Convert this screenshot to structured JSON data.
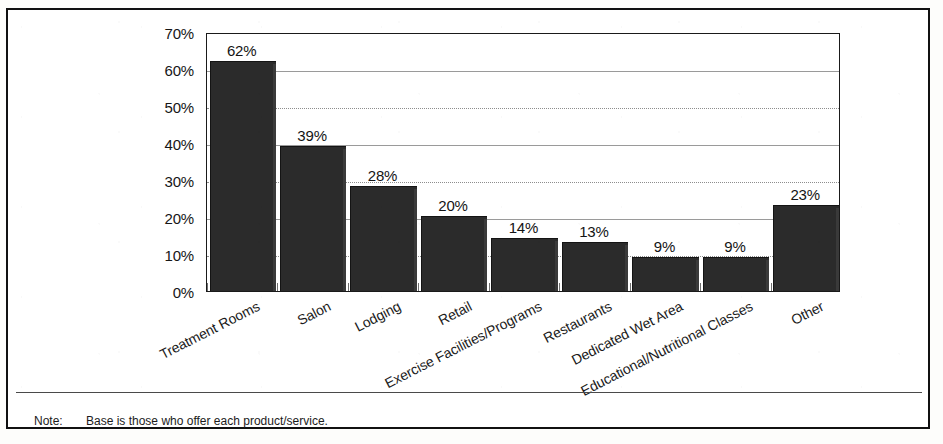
{
  "frame": {
    "title_fragment": ""
  },
  "chart_data": {
    "type": "bar",
    "title": "",
    "xlabel": "",
    "ylabel": "Percent of Revenue",
    "ylim": [
      0,
      70
    ],
    "ytick_step": 10,
    "ytick_labels": [
      "0%",
      "10%",
      "20%",
      "30%",
      "40%",
      "50%",
      "60%",
      "70%"
    ],
    "ytick_values": [
      0,
      10,
      20,
      30,
      40,
      50,
      60,
      70
    ],
    "grid": true,
    "legend": "none",
    "categories": [
      "Treatment Rooms",
      "Salon",
      "Lodging",
      "Retail",
      "Exercise Facilities/Programs",
      "Restaurants",
      "Dedicated Wet Area",
      "Educational/Nutritional Classes",
      "Other"
    ],
    "values": [
      62,
      39,
      28,
      20,
      14,
      13,
      9,
      9,
      23
    ],
    "value_labels": [
      "62%",
      "39%",
      "28%",
      "20%",
      "14%",
      "13%",
      "9%",
      "9%",
      "23%"
    ],
    "bar_color": "#2b2b2b"
  },
  "note": {
    "label": "Note:",
    "text": "Base is those who offer each product/service."
  }
}
